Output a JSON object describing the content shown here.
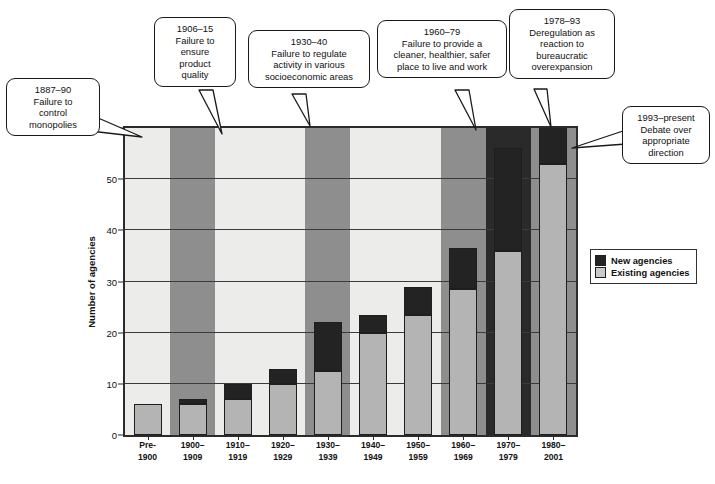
{
  "chart_data": {
    "type": "bar",
    "stacked": true,
    "title": "",
    "xlabel": "",
    "ylabel": "Number of agencies",
    "ylim": [
      0,
      60
    ],
    "yticks": [
      0,
      10,
      20,
      30,
      40,
      50,
      60
    ],
    "grid": true,
    "legend_position": "right",
    "categories": [
      "Pre-1900",
      "1900-1909",
      "1910-1919",
      "1920-1929",
      "1930-1939",
      "1940-1949",
      "1950-1959",
      "1960-1969",
      "1970-1979",
      "1980-2001"
    ],
    "category_labels": [
      {
        "line1": "Pre-",
        "line2": "1900"
      },
      {
        "line1": "1900–",
        "line2": "1909"
      },
      {
        "line1": "1910–",
        "line2": "1919"
      },
      {
        "line1": "1920–",
        "line2": "1929"
      },
      {
        "line1": "1930–",
        "line2": "1939"
      },
      {
        "line1": "1940–",
        "line2": "1949"
      },
      {
        "line1": "1950–",
        "line2": "1959"
      },
      {
        "line1": "1960–",
        "line2": "1969"
      },
      {
        "line1": "1970–",
        "line2": "1979"
      },
      {
        "line1": "1980–",
        "line2": "2001"
      }
    ],
    "series": [
      {
        "name": "Existing agencies",
        "color": "#b4b4b4",
        "values": [
          6,
          6,
          7,
          10,
          12.5,
          20,
          23.5,
          28.5,
          36,
          53
        ]
      },
      {
        "name": "New agencies",
        "color": "#232323",
        "values": [
          0,
          1,
          3,
          3,
          9.5,
          3.5,
          5.5,
          8,
          20,
          8
        ]
      }
    ],
    "totals": [
      6,
      7,
      10,
      13,
      22,
      23.5,
      29,
      36.5,
      56,
      61
    ],
    "era_bands": [
      {
        "label": "1906-15 era",
        "start_index": 1,
        "end_index": 1,
        "shade": "gray"
      },
      {
        "label": "1930-40 era",
        "start_index": 4,
        "end_index": 4,
        "shade": "gray"
      },
      {
        "label": "1960-79 era",
        "start_index": 7,
        "end_index": 8,
        "shade": "gray"
      },
      {
        "label": "1978-93 era",
        "start_index": 8,
        "end_index": 8,
        "shade": "dark"
      },
      {
        "label": "1993-present era",
        "start_index": 9,
        "end_index": 9,
        "shade": "gray"
      }
    ]
  },
  "legend": {
    "items": [
      {
        "label": "New agencies",
        "swatch": "new"
      },
      {
        "label": "Existing agencies",
        "swatch": "existing"
      }
    ]
  },
  "callouts": [
    {
      "id": "callout-1887-90",
      "lines": [
        "1887–90",
        "Failure to",
        "control",
        "monopolies"
      ]
    },
    {
      "id": "callout-1906-15",
      "lines": [
        "1906–15",
        "Failure to",
        "ensure",
        "product",
        "quality"
      ]
    },
    {
      "id": "callout-1930-40",
      "lines": [
        "1930–40",
        "Failure to regulate",
        "activity in various",
        "socioeconomic areas"
      ]
    },
    {
      "id": "callout-1960-79",
      "lines": [
        "1960–79",
        "Failure to provide a",
        "cleaner, healthier, safer",
        "place to live and work"
      ]
    },
    {
      "id": "callout-1978-93",
      "lines": [
        "1978–93",
        "Deregulation as",
        "reaction to",
        "bureaucratic",
        "overexpansion"
      ]
    },
    {
      "id": "callout-1993-present",
      "lines": [
        "1993–present",
        "Debate over",
        "appropriate",
        "direction"
      ]
    }
  ],
  "yaxis": {
    "title": "Number of agencies",
    "ticks": [
      "0",
      "10",
      "20",
      "30",
      "40",
      "50",
      "60"
    ]
  }
}
